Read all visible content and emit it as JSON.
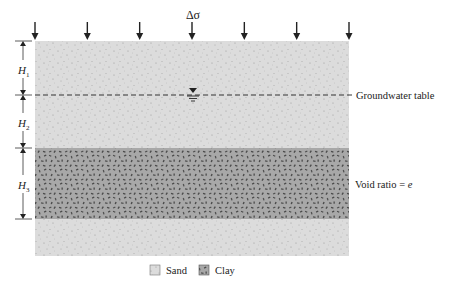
{
  "load": {
    "label": "Δσ",
    "arrow_count": 7
  },
  "dimensions": [
    {
      "id": "H1",
      "symbol": "H",
      "subscript": "1"
    },
    {
      "id": "H2",
      "symbol": "H",
      "subscript": "2"
    },
    {
      "id": "H3",
      "symbol": "H",
      "subscript": "3"
    }
  ],
  "annotations": {
    "groundwater_table": "Groundwater table",
    "void_ratio_label": "Void ratio = ",
    "void_ratio_symbol": "e"
  },
  "legend": [
    {
      "name": "sand",
      "label": "Sand"
    },
    {
      "name": "clay",
      "label": "Clay"
    }
  ],
  "colors": {
    "sand_fill": "#dcdcdc",
    "sand_dot": "#9a9a9a",
    "clay_fill": "#a8a8a8",
    "clay_grain": "#4a4a4a",
    "line": "#222222"
  }
}
